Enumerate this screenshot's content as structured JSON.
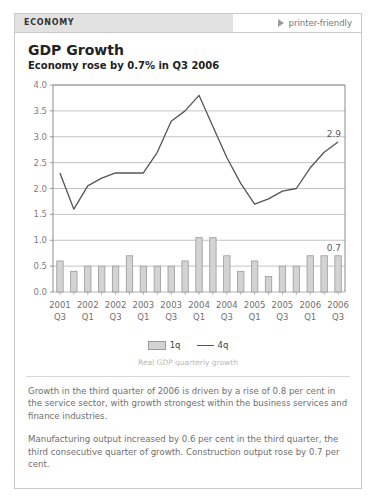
{
  "header": {
    "section_label": "ECONOMY",
    "printer_friendly_label": "printer-friendly",
    "printer_icon": "play-triangle-icon"
  },
  "titles": {
    "headline": "GDP Growth",
    "subhead": "Economy rose by 0.7% in Q3 2006"
  },
  "legend": {
    "bar_label": "1q",
    "line_label": "4q"
  },
  "caption": "Real GDP quarterly growth",
  "body": {
    "paragraph_1": "Growth in the third quarter of 2006 is driven by a rise of 0.8 per cent in the service sector, with growth strongest within the business services and finance industries.",
    "paragraph_2": "Manufacturing output increased by 0.6 per cent in the third quarter, the third consecutive quarter of growth. Construction output rose by 0.7 per cent."
  },
  "colors": {
    "header_bg": "#e2e2e2",
    "card_border": "#c9c9c9",
    "bar_fill": "#d3d3d3",
    "bar_stroke": "#9a9a9a",
    "line_stroke": "#555555",
    "grid": "#b5b5b5",
    "text_body": "#6f6f6f",
    "text_caption": "#b9b9b9"
  },
  "chart_data": {
    "type": "bar",
    "title": "GDP Growth",
    "subtitle": "Economy rose by 0.7% in Q3 2006",
    "xlabel": "",
    "ylabel": "",
    "ylim": [
      0.0,
      4.0
    ],
    "yticks": [
      "0.0",
      "0.5",
      "1.0",
      "1.5",
      "2.0",
      "2.5",
      "3.0",
      "3.5",
      "4.0"
    ],
    "ytick_values": [
      0.0,
      0.5,
      1.0,
      1.5,
      2.0,
      2.5,
      3.0,
      3.5,
      4.0
    ],
    "grid": true,
    "legend_position": "bottom-center",
    "x": [
      "2001 Q3",
      "2001 Q4",
      "2002 Q1",
      "2002 Q2",
      "2002 Q3",
      "2002 Q4",
      "2003 Q1",
      "2003 Q2",
      "2003 Q3",
      "2003 Q4",
      "2004 Q1",
      "2004 Q2",
      "2004 Q3",
      "2004 Q4",
      "2005 Q1",
      "2005 Q2",
      "2005 Q3",
      "2005 Q4",
      "2006 Q1",
      "2006 Q2",
      "2006 Q3"
    ],
    "xtick_labels": [
      {
        "index": 0,
        "line1": "2001",
        "line2": "Q3"
      },
      {
        "index": 2,
        "line1": "2002",
        "line2": "Q1"
      },
      {
        "index": 4,
        "line1": "2002",
        "line2": "Q3"
      },
      {
        "index": 6,
        "line1": "2003",
        "line2": "Q1"
      },
      {
        "index": 8,
        "line1": "2003",
        "line2": "Q3"
      },
      {
        "index": 10,
        "line1": "2004",
        "line2": "Q1"
      },
      {
        "index": 12,
        "line1": "2004",
        "line2": "Q3"
      },
      {
        "index": 14,
        "line1": "2005",
        "line2": "Q1"
      },
      {
        "index": 16,
        "line1": "2005",
        "line2": "Q3"
      },
      {
        "index": 18,
        "line1": "2006",
        "line2": "Q1"
      },
      {
        "index": 20,
        "line1": "2006",
        "line2": "Q3"
      }
    ],
    "series": [
      {
        "name": "1q",
        "type": "bar",
        "values": [
          0.6,
          0.4,
          0.5,
          0.5,
          0.5,
          0.7,
          0.5,
          0.5,
          0.5,
          0.6,
          1.05,
          1.05,
          0.7,
          0.4,
          0.6,
          0.3,
          0.5,
          0.5,
          0.7,
          0.7,
          0.7
        ]
      },
      {
        "name": "4q",
        "type": "line",
        "values": [
          2.3,
          1.6,
          2.05,
          2.2,
          2.3,
          2.3,
          2.3,
          2.7,
          3.3,
          3.5,
          3.8,
          3.2,
          2.6,
          2.1,
          1.7,
          1.8,
          1.95,
          2.0,
          2.4,
          2.7,
          2.9
        ]
      }
    ],
    "annotations": [
      {
        "text": "2.9",
        "series": "4q",
        "value": 2.9,
        "at_index": 20
      },
      {
        "text": "0.7",
        "series": "1q",
        "value": 0.7,
        "at_index": 20
      }
    ]
  }
}
